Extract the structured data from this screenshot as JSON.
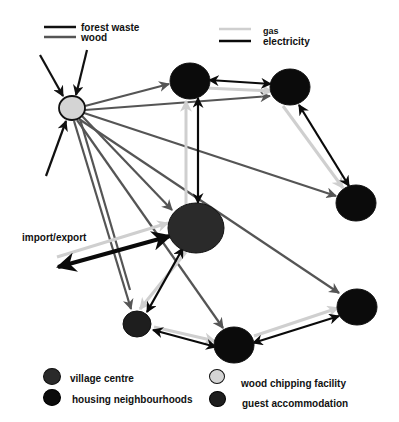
{
  "colors": {
    "forest_waste": "#111111",
    "wood": "#555555",
    "gas": "#cfcfcf",
    "electricity": "#0a0a0a",
    "village_centre": "#2a2a2a",
    "housing_neighbourhoods": "#0b0b0b",
    "wood_chipping_facility": "#d4d4d4",
    "guest_accommodation": "#1e1e1e"
  },
  "legend_flows": [
    {
      "id": "forest_waste",
      "label": "forest waste"
    },
    {
      "id": "wood",
      "label": "wood"
    },
    {
      "id": "gas",
      "label": "gas"
    },
    {
      "id": "electricity",
      "label": "electricity"
    }
  ],
  "legend_nodes": [
    {
      "id": "village_centre",
      "label": "village  centre"
    },
    {
      "id": "housing_neighbourhoods",
      "label": "housing neighbourhoods"
    },
    {
      "id": "wood_chipping_facility",
      "label": "wood chipping facility"
    },
    {
      "id": "guest_accommodation",
      "label": "guest accommodation"
    }
  ],
  "annotations": {
    "import_export": "import/export"
  },
  "nodes": [
    {
      "id": "chipping",
      "type": "wood_chipping_facility",
      "cx": 72,
      "cy": 108,
      "rx": 13,
      "ry": 12
    },
    {
      "id": "house_top_left",
      "type": "housing_neighbourhoods",
      "cx": 190,
      "cy": 81,
      "rx": 20,
      "ry": 18
    },
    {
      "id": "house_top_right",
      "type": "housing_neighbourhoods",
      "cx": 290,
      "cy": 87,
      "rx": 20,
      "ry": 18
    },
    {
      "id": "house_right",
      "type": "housing_neighbourhoods",
      "cx": 356,
      "cy": 203,
      "rx": 20,
      "ry": 18
    },
    {
      "id": "village",
      "type": "village_centre",
      "cx": 196,
      "cy": 228,
      "rx": 28,
      "ry": 25
    },
    {
      "id": "guest",
      "type": "guest_accommodation",
      "cx": 137,
      "cy": 324,
      "rx": 14,
      "ry": 13
    },
    {
      "id": "house_bottom_mid",
      "type": "housing_neighbourhoods",
      "cx": 234,
      "cy": 345,
      "rx": 20,
      "ry": 18
    },
    {
      "id": "house_bottom_right",
      "type": "housing_neighbourhoods",
      "cx": 357,
      "cy": 307,
      "rx": 20,
      "ry": 18
    }
  ],
  "edges": [
    {
      "flow": "forest_waste",
      "x1": 40,
      "y1": 55,
      "x2": 63,
      "y2": 96,
      "head": "end"
    },
    {
      "flow": "forest_waste",
      "x1": 87,
      "y1": 50,
      "x2": 76,
      "y2": 95,
      "head": "end"
    },
    {
      "flow": "forest_waste",
      "x1": 46,
      "y1": 176,
      "x2": 66,
      "y2": 121,
      "head": "end"
    },
    {
      "flow": "wood",
      "x1": 85,
      "y1": 106,
      "x2": 169,
      "y2": 84,
      "head": "end"
    },
    {
      "flow": "wood",
      "x1": 85,
      "y1": 110,
      "x2": 270,
      "y2": 96,
      "head": "end"
    },
    {
      "flow": "wood",
      "x1": 84,
      "y1": 113,
      "x2": 336,
      "y2": 196,
      "head": "end"
    },
    {
      "flow": "wood",
      "x1": 82,
      "y1": 116,
      "x2": 172,
      "y2": 210,
      "head": "end"
    },
    {
      "flow": "wood",
      "x1": 79,
      "y1": 119,
      "x2": 339,
      "y2": 293,
      "head": "end"
    },
    {
      "flow": "wood",
      "x1": 77,
      "y1": 120,
      "x2": 223,
      "y2": 328,
      "head": "end"
    },
    {
      "flow": "wood",
      "x1": 74,
      "y1": 121,
      "x2": 131,
      "y2": 309,
      "head": "end"
    },
    {
      "flow": "wood",
      "x1": 80,
      "y1": 119,
      "x2": 130,
      "y2": 290,
      "head": "none"
    },
    {
      "flow": "gas",
      "x1": 186,
      "y1": 205,
      "x2": 186,
      "y2": 101,
      "head": "end"
    },
    {
      "flow": "gas",
      "x1": 57,
      "y1": 257,
      "x2": 168,
      "y2": 223,
      "head": "end"
    },
    {
      "flow": "gas",
      "x1": 186,
      "y1": 252,
      "x2": 140,
      "y2": 309,
      "head": "end"
    },
    {
      "flow": "gas",
      "x1": 205,
      "y1": 88,
      "x2": 272,
      "y2": 91,
      "head": "end"
    },
    {
      "flow": "gas",
      "x1": 283,
      "y1": 106,
      "x2": 343,
      "y2": 188,
      "head": "end"
    },
    {
      "flow": "gas",
      "x1": 154,
      "y1": 327,
      "x2": 215,
      "y2": 341,
      "head": "end"
    },
    {
      "flow": "gas",
      "x1": 254,
      "y1": 336,
      "x2": 338,
      "y2": 308,
      "head": "end"
    },
    {
      "flow": "electricity",
      "x1": 198,
      "y1": 98,
      "x2": 198,
      "y2": 203,
      "head": "both"
    },
    {
      "flow": "electricity",
      "x1": 58,
      "y1": 267,
      "x2": 170,
      "y2": 236,
      "head": "both",
      "width": 4
    },
    {
      "flow": "electricity",
      "x1": 183,
      "y1": 248,
      "x2": 147,
      "y2": 312,
      "head": "both"
    },
    {
      "flow": "electricity",
      "x1": 209,
      "y1": 80,
      "x2": 271,
      "y2": 84,
      "head": "both"
    },
    {
      "flow": "electricity",
      "x1": 299,
      "y1": 105,
      "x2": 349,
      "y2": 186,
      "head": "both"
    },
    {
      "flow": "electricity",
      "x1": 153,
      "y1": 330,
      "x2": 216,
      "y2": 347,
      "head": "both"
    },
    {
      "flow": "electricity",
      "x1": 253,
      "y1": 343,
      "x2": 339,
      "y2": 316,
      "head": "both"
    }
  ]
}
